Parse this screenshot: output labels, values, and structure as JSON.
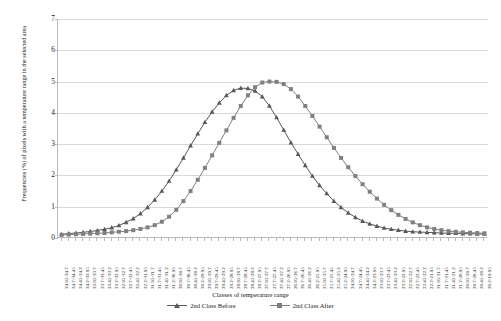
{
  "chart_data": {
    "type": "line",
    "title": "",
    "xlabel": "Classes of temperature range",
    "ylabel": "Frequencies (%) of pixels with a temperature range in the selected area",
    "ylim": [
      0,
      7
    ],
    "yticks": [
      0,
      1,
      2,
      3,
      4,
      5,
      6,
      7
    ],
    "grid": true,
    "legend_position": "bottom",
    "categories": [
      "34.95-34.7",
      "34.7-34.45",
      "34.45-34.2",
      "34.2-33.95",
      "33.95-33.7",
      "33.7-33.45",
      "33.45-33.2",
      "33.2-32.95",
      "32.95-32.7",
      "32.7-32.45",
      "32.45-32.2",
      "32.2-31.95",
      "31.95-31.7",
      "31.7-31.45",
      "31.45-31.2",
      "31.2-30.95",
      "30.95-30.7",
      "30.7-30.45",
      "30.45-30.2",
      "30.2-29.95",
      "29.95-29.7",
      "29.7-29.45",
      "29.45-29.2",
      "29.2-28.95",
      "28.95-28.7",
      "28.7-28.45",
      "28.45-28.2",
      "28.2-27.95",
      "27.95-27.7",
      "27.7-27.45",
      "27.45-27.2",
      "27.2-26.95",
      "26.95-26.7",
      "26.7-26.45",
      "26.45-26.2",
      "26.2-25.95",
      "25.95-25.7",
      "25.7-25.45",
      "25.45-25.2",
      "25.2-24.95",
      "24.95-24.7",
      "24.7-24.45",
      "24.45-24.2",
      "24.2-23.95",
      "23.95-23.7",
      "23.7-23.45",
      "23.45-23.2",
      "23.2-22.95",
      "22.95-22.7",
      "22.7-22.45",
      "22.45-22.2",
      "22.2-21.95",
      "21.95-21.7",
      "21.7-21.45",
      "21.45-21.2",
      "21.2-20.95",
      "20.95-20.7",
      "20.7-20.45",
      "20.45-20.2",
      "20.2-19.95"
    ],
    "series": [
      {
        "name": "2nd Class Before",
        "marker": "triangle",
        "color": "#595959",
        "values": [
          0.12,
          0.14,
          0.16,
          0.18,
          0.21,
          0.24,
          0.28,
          0.33,
          0.4,
          0.5,
          0.62,
          0.78,
          0.98,
          1.22,
          1.5,
          1.82,
          2.18,
          2.56,
          2.95,
          3.33,
          3.7,
          4.03,
          4.32,
          4.56,
          4.72,
          4.79,
          4.78,
          4.7,
          4.52,
          4.22,
          3.85,
          3.45,
          3.05,
          2.68,
          2.32,
          1.98,
          1.68,
          1.42,
          1.18,
          0.98,
          0.8,
          0.66,
          0.54,
          0.45,
          0.38,
          0.32,
          0.28,
          0.25,
          0.22,
          0.2,
          0.19,
          0.18,
          0.17,
          0.16,
          0.15,
          0.15,
          0.14,
          0.14,
          0.13,
          0.13
        ]
      },
      {
        "name": "2nd Class After",
        "marker": "square",
        "color": "#808080",
        "values": [
          0.1,
          0.11,
          0.12,
          0.13,
          0.14,
          0.15,
          0.16,
          0.18,
          0.2,
          0.22,
          0.25,
          0.29,
          0.34,
          0.41,
          0.52,
          0.68,
          0.9,
          1.18,
          1.5,
          1.86,
          2.24,
          2.64,
          3.04,
          3.44,
          3.84,
          4.22,
          4.56,
          4.82,
          4.97,
          5.0,
          4.99,
          4.92,
          4.76,
          4.52,
          4.22,
          3.9,
          3.56,
          3.22,
          2.88,
          2.56,
          2.26,
          1.98,
          1.72,
          1.48,
          1.26,
          1.06,
          0.89,
          0.74,
          0.61,
          0.5,
          0.41,
          0.34,
          0.29,
          0.25,
          0.22,
          0.2,
          0.18,
          0.17,
          0.16,
          0.15
        ]
      }
    ]
  }
}
